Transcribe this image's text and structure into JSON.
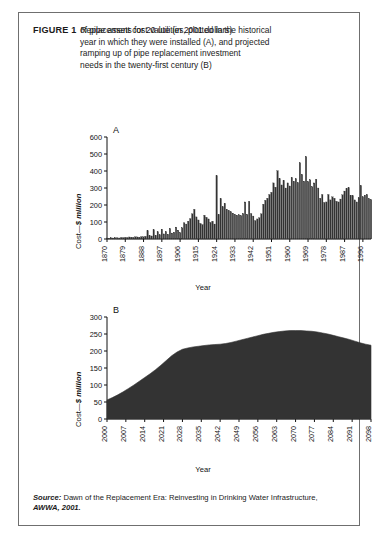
{
  "figure": {
    "label": "FIGURE 1",
    "caption_line1": "Replacement cost value (in 2001 dollars)",
    "caption_line2": "of pipe assets for 20 utilities, plotted in the historical",
    "caption_line3": "year in which they were installed (A), and projected",
    "caption_line4": "ramping up of pipe replacement investment",
    "caption_line5": "needs in the twenty-first century (B)",
    "source_label": "Source:",
    "source_text": " Dawn of the Replacement Era: Reinvesting in Drinking Water Infrastructure, ",
    "source_ref": "AWWA, 2001.",
    "border_color": "#6f6f6f",
    "ink_color": "#2b2b2b"
  },
  "chart_data": [
    {
      "id": "panel-a",
      "type": "bar",
      "panel_letter": "A",
      "title": "",
      "xlabel": "Year",
      "ylabel": "Cost—$ million",
      "ylim": [
        0,
        600
      ],
      "yticks": [
        0,
        100,
        200,
        300,
        400,
        500,
        600
      ],
      "xlim": [
        1870,
        2000
      ],
      "xticks": [
        1870,
        1879,
        1888,
        1897,
        1906,
        1915,
        1924,
        1933,
        1942,
        1951,
        1960,
        1969,
        1978,
        1987,
        1996
      ],
      "grid": false,
      "legend": "none",
      "bar_color": "#333333",
      "categories": [
        1870,
        1871,
        1872,
        1873,
        1874,
        1875,
        1876,
        1877,
        1878,
        1879,
        1880,
        1881,
        1882,
        1883,
        1884,
        1885,
        1886,
        1887,
        1888,
        1889,
        1890,
        1891,
        1892,
        1893,
        1894,
        1895,
        1896,
        1897,
        1898,
        1899,
        1900,
        1901,
        1902,
        1903,
        1904,
        1905,
        1906,
        1907,
        1908,
        1909,
        1910,
        1911,
        1912,
        1913,
        1914,
        1915,
        1916,
        1917,
        1918,
        1919,
        1920,
        1921,
        1922,
        1923,
        1924,
        1925,
        1926,
        1927,
        1928,
        1929,
        1930,
        1931,
        1932,
        1933,
        1934,
        1935,
        1936,
        1937,
        1938,
        1939,
        1940,
        1941,
        1942,
        1943,
        1944,
        1945,
        1946,
        1947,
        1948,
        1949,
        1950,
        1951,
        1952,
        1953,
        1954,
        1955,
        1956,
        1957,
        1958,
        1959,
        1960,
        1961,
        1962,
        1963,
        1964,
        1965,
        1966,
        1967,
        1968,
        1969,
        1970,
        1971,
        1972,
        1973,
        1974,
        1975,
        1976,
        1977,
        1978,
        1979,
        1980,
        1981,
        1982,
        1983,
        1984,
        1985,
        1986,
        1987,
        1988,
        1989,
        1990,
        1991,
        1992,
        1993,
        1994,
        1995,
        1996,
        1997,
        1998,
        1999,
        2000
      ],
      "values": [
        6,
        5,
        7,
        6,
        8,
        7,
        6,
        9,
        8,
        10,
        9,
        12,
        11,
        10,
        13,
        12,
        11,
        14,
        13,
        16,
        48,
        20,
        18,
        54,
        22,
        42,
        25,
        58,
        30,
        44,
        28,
        62,
        35,
        40,
        70,
        52,
        38,
        66,
        95,
        88,
        105,
        120,
        148,
        175,
        130,
        112,
        92,
        85,
        140,
        128,
        118,
        98,
        105,
        88,
        372,
        145,
        238,
        190,
        210,
        175,
        168,
        160,
        152,
        145,
        140,
        142,
        138,
        150,
        218,
        145,
        222,
        150,
        135,
        108,
        118,
        125,
        148,
        205,
        228,
        240,
        262,
        275,
        330,
        305,
        402,
        355,
        318,
        345,
        300,
        330,
        312,
        362,
        340,
        355,
        332,
        448,
        380,
        340,
        485,
        338,
        348,
        308,
        330,
        352,
        300,
        240,
        262,
        215,
        218,
        262,
        230,
        248,
        240,
        222,
        218,
        235,
        260,
        282,
        298,
        302,
        258,
        255,
        230,
        218,
        242,
        315,
        248,
        258,
        262,
        238,
        232,
        282,
        210,
        110,
        40
      ]
    },
    {
      "id": "panel-b",
      "type": "area",
      "panel_letter": "B",
      "title": "",
      "xlabel": "Year",
      "ylabel": "Cost—$ million",
      "ylim": [
        0,
        300
      ],
      "yticks": [
        0,
        50,
        100,
        150,
        200,
        250,
        300
      ],
      "xlim": [
        2000,
        2098
      ],
      "xticks": [
        2000,
        2007,
        2014,
        2021,
        2028,
        2035,
        2042,
        2049,
        2056,
        2063,
        2070,
        2077,
        2084,
        2091,
        2098
      ],
      "grid": false,
      "legend": "none",
      "area_color": "#333333",
      "x": [
        2000,
        2002,
        2004,
        2006,
        2008,
        2010,
        2012,
        2014,
        2016,
        2018,
        2020,
        2022,
        2024,
        2026,
        2028,
        2030,
        2032,
        2034,
        2036,
        2038,
        2040,
        2042,
        2044,
        2046,
        2048,
        2050,
        2052,
        2054,
        2056,
        2058,
        2060,
        2062,
        2064,
        2066,
        2068,
        2070,
        2072,
        2074,
        2076,
        2078,
        2080,
        2082,
        2084,
        2086,
        2088,
        2090,
        2092,
        2094,
        2096,
        2098
      ],
      "values": [
        56,
        63,
        71,
        80,
        90,
        100,
        111,
        122,
        133,
        145,
        158,
        172,
        186,
        197,
        205,
        209,
        212,
        214,
        216,
        218,
        219,
        220,
        222,
        225,
        229,
        233,
        237,
        241,
        245,
        249,
        252,
        255,
        257,
        259,
        260,
        260,
        260,
        259,
        258,
        256,
        253,
        250,
        246,
        242,
        238,
        234,
        229,
        224,
        220,
        217
      ]
    }
  ]
}
